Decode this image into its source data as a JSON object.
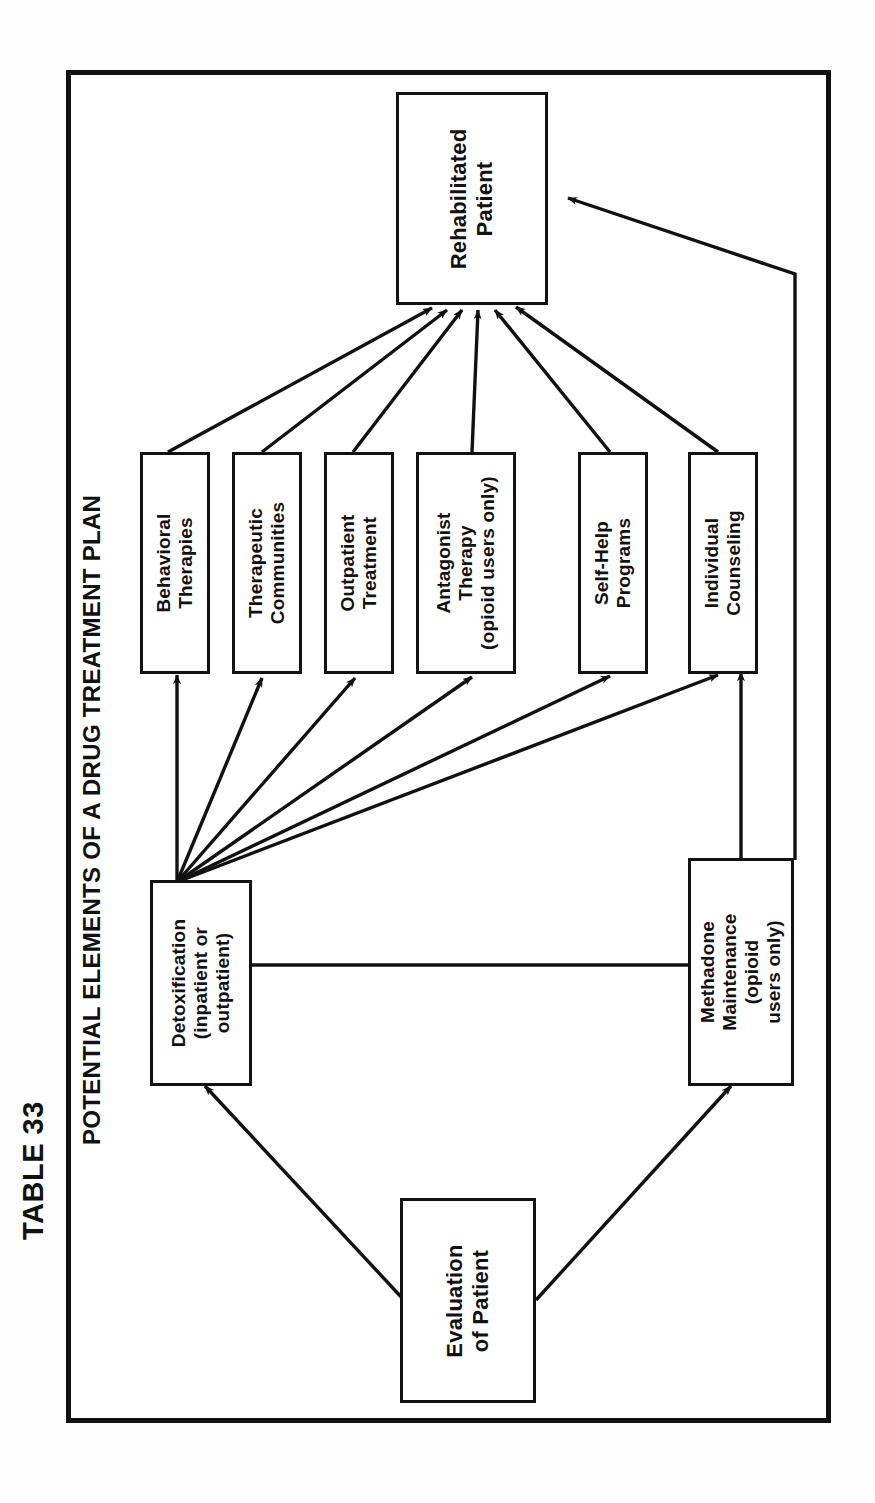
{
  "table_label": "TABLE 33",
  "diagram": {
    "title": "POTENTIAL ELEMENTS OF A DRUG TREATMENT PLAN",
    "orientation": "rotated-90-ccw",
    "nodes": [
      {
        "id": "rehabilitated-patient",
        "label": "Rehabilitated\nPatient"
      },
      {
        "id": "behavioral-therapies",
        "label": "Behavioral\nTherapies"
      },
      {
        "id": "therapeutic-communities",
        "label": "Therapeutic\nCommunities"
      },
      {
        "id": "outpatient-treatment",
        "label": "Outpatient\nTreatment"
      },
      {
        "id": "antagonist-therapy",
        "label": "Antagonist\nTherapy\n(opioid users only)"
      },
      {
        "id": "self-help-programs",
        "label": "Self-Help\nPrograms"
      },
      {
        "id": "individual-counseling",
        "label": "Individual\nCounseling"
      },
      {
        "id": "detoxification",
        "label": "Detoxification\n(inpatient or\noutpatient)"
      },
      {
        "id": "methadone-maintenance",
        "label": "Methadone\nMaintenance\n(opioid\nusers only)"
      },
      {
        "id": "evaluation-of-patient",
        "label": "Evaluation\nof Patient"
      }
    ],
    "edges": [
      {
        "from": "evaluation-of-patient",
        "to": "detoxification"
      },
      {
        "from": "evaluation-of-patient",
        "to": "methadone-maintenance"
      },
      {
        "from": "methadone-maintenance",
        "to": "detoxification"
      },
      {
        "from": "methadone-maintenance",
        "to": "individual-counseling"
      },
      {
        "from": "methadone-maintenance",
        "to": "rehabilitated-patient"
      },
      {
        "from": "detoxification",
        "to": "behavioral-therapies"
      },
      {
        "from": "detoxification",
        "to": "therapeutic-communities"
      },
      {
        "from": "detoxification",
        "to": "outpatient-treatment"
      },
      {
        "from": "detoxification",
        "to": "antagonist-therapy"
      },
      {
        "from": "detoxification",
        "to": "self-help-programs"
      },
      {
        "from": "detoxification",
        "to": "individual-counseling"
      },
      {
        "from": "behavioral-therapies",
        "to": "rehabilitated-patient"
      },
      {
        "from": "therapeutic-communities",
        "to": "rehabilitated-patient"
      },
      {
        "from": "outpatient-treatment",
        "to": "rehabilitated-patient"
      },
      {
        "from": "antagonist-therapy",
        "to": "rehabilitated-patient"
      },
      {
        "from": "self-help-programs",
        "to": "rehabilitated-patient"
      },
      {
        "from": "individual-counseling",
        "to": "rehabilitated-patient"
      }
    ],
    "colors": {
      "ink": "#111111",
      "paper": "#ffffff"
    }
  }
}
